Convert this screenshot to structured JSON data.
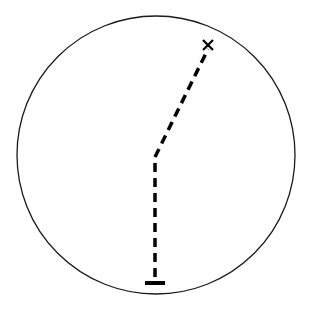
{
  "diagram": {
    "type": "path-in-circle",
    "colors": {
      "background": "#ffffff",
      "stroke": "#000000",
      "circle_stroke": "#1a1a1a"
    },
    "circle": {
      "cx": 156,
      "cy": 155,
      "r": 139,
      "stroke_width": 1.3
    },
    "start_marker": {
      "shape": "bar",
      "icon": "start-bar-icon",
      "x1": 145,
      "x2": 165,
      "y": 283,
      "stroke_width": 4
    },
    "path": {
      "style": "dashed",
      "dasharray": "9,6",
      "stroke_width": 3.5,
      "points": [
        [
          155,
          277
        ],
        [
          155,
          157
        ],
        [
          208,
          49
        ]
      ]
    },
    "end_marker": {
      "shape": "x",
      "icon": "end-x-icon",
      "cx": 208,
      "cy": 45,
      "size": 5,
      "stroke_width": 2.2
    }
  }
}
